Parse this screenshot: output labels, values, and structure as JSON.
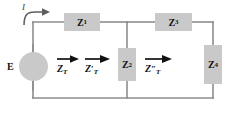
{
  "diagram": {
    "source": {
      "label": "E",
      "symbol": "ac-voltage-source-sine"
    },
    "current": {
      "label": "I"
    },
    "impedances": [
      {
        "key": "z1",
        "base": "Z",
        "sub": "1",
        "orientation": "horizontal"
      },
      {
        "key": "z2",
        "base": "Z",
        "sub": "2",
        "orientation": "vertical"
      },
      {
        "key": "z3",
        "base": "Z",
        "sub": "3",
        "orientation": "horizontal"
      },
      {
        "key": "z4",
        "base": "Z",
        "sub": "4",
        "orientation": "vertical"
      }
    ],
    "total_impedance_labels": [
      {
        "key": "zt",
        "base": "Z",
        "prime": "",
        "sub": "T"
      },
      {
        "key": "zt_prime",
        "base": "Z",
        "prime": "′",
        "sub": "T"
      },
      {
        "key": "zt_dprime",
        "base": "Z",
        "prime": "″",
        "sub": "T"
      }
    ],
    "colors": {
      "component_fill": "#c9c9c9",
      "wire": "#8d8d8d",
      "text": "#111111",
      "background": "#ffffff"
    }
  }
}
